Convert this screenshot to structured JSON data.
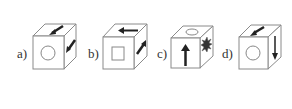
{
  "diagram": {
    "type": "cube-options",
    "colors": {
      "stroke": "#8a8a8a",
      "fill": "#ffffff",
      "symbol": "#222222",
      "outline_symbol": "#888888"
    },
    "options": [
      {
        "label": "a)",
        "front": "circle",
        "top": "arrow-down-left",
        "right": "arrow-down-left"
      },
      {
        "label": "b)",
        "front": "square",
        "top": "arrow-left",
        "right": "arrow-up-right"
      },
      {
        "label": "c)",
        "front": "arrow-up",
        "top": "ellipse",
        "right": "starburst"
      },
      {
        "label": "d)",
        "front": "circle",
        "top": "arrow-down-left",
        "right": "arrow-down"
      }
    ]
  }
}
